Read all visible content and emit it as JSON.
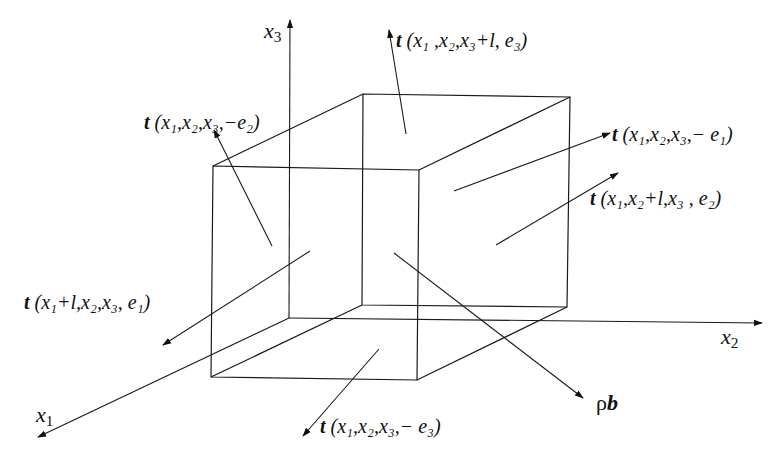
{
  "figure": {
    "axes": [
      {
        "name": "x1",
        "symbol": "x",
        "sub": "1"
      },
      {
        "name": "x2",
        "symbol": "x",
        "sub": "2"
      },
      {
        "name": "x3",
        "symbol": "x",
        "sub": "3"
      }
    ],
    "vectors": [
      {
        "id": "top",
        "t": "t",
        "args": "(x₁ ,x₂,x₃+l, e₃)"
      },
      {
        "id": "left",
        "t": "t",
        "args": "(x₁,x₂,x₃,−e₂)"
      },
      {
        "id": "back",
        "t": "t",
        "args": "(x₁,x₂,x₃,− e₁)"
      },
      {
        "id": "right",
        "t": "t",
        "args": "(x₁,x₂+l,x₃ , e₂)"
      },
      {
        "id": "front",
        "t": "t",
        "args": "(x₁+l,x₂,x₃, e₁)"
      },
      {
        "id": "bottom",
        "t": "t",
        "args": "(x₁,x₂,x₃,− e₃)"
      }
    ],
    "body_force": {
      "rho": "ρ",
      "b": "b"
    },
    "colors": {
      "line": "#1a1a1a",
      "background": "#ffffff"
    }
  }
}
